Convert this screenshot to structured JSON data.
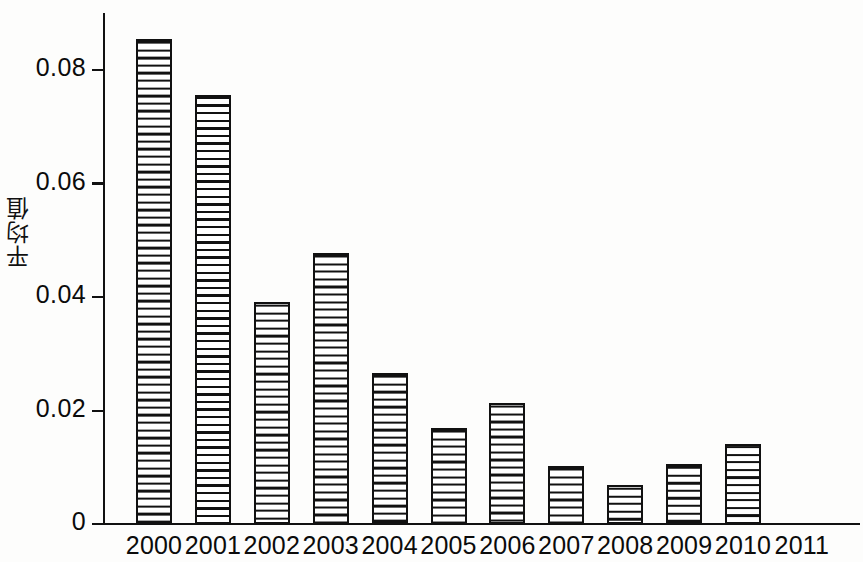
{
  "chart_data": {
    "type": "bar",
    "title": "",
    "subtitle": "",
    "xlabel": "",
    "ylabel": "平均值",
    "categories": [
      "2000",
      "2001",
      "2002",
      "2003",
      "2004",
      "2005",
      "2006",
      "2007",
      "2008",
      "2009",
      "2010",
      "2011"
    ],
    "values": [
      0.0855,
      0.0755,
      0.0392,
      0.0478,
      0.0267,
      0.017,
      0.0214,
      0.0103,
      0.007,
      0.0107,
      0.0141,
      null
    ],
    "ylim": [
      0,
      0.088
    ],
    "yticks": [
      0,
      0.02,
      0.04,
      0.06,
      0.08
    ],
    "ytick_labels": [
      "0",
      "0.02",
      "0.04",
      "0.06",
      "0.08"
    ],
    "grid": false,
    "legend": null,
    "bar_fill": "horizontal-hatch",
    "bar_edge_color": "#111111",
    "bar_fill_color": "#ffffff"
  },
  "axes": {
    "y_axis_title": "平均值",
    "y_tick_labels": [
      "0.08",
      "0.06",
      "0.04",
      "0.02",
      "0"
    ],
    "x_tick_labels": [
      "2000",
      "2001",
      "2002",
      "2003",
      "2004",
      "2005",
      "2006",
      "2007",
      "2008",
      "2009",
      "2010",
      "2011"
    ]
  },
  "colors": {
    "axis": "#111111",
    "hatch": "#111111",
    "background": "#fdfdfc",
    "text": "#0b0b0b"
  }
}
